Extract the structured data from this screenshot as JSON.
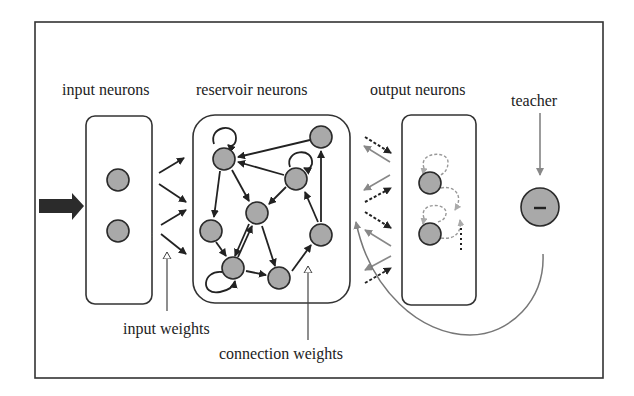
{
  "diagram": {
    "labels": {
      "input_neurons": "input neurons",
      "reservoir_neurons": "reservoir neurons",
      "output_neurons": "output neurons",
      "teacher": "teacher",
      "input_weights": "input weights",
      "connection_weights": "connection weights"
    },
    "teacher_symbol": "–",
    "colors": {
      "frame": "#333333",
      "node_fill": "#a9a9a9",
      "node_stroke": "#2a2a2a",
      "edge": "#222222",
      "feedback_edge": "#888888",
      "dashed_edge": "#999999"
    },
    "groups": [
      {
        "id": "input",
        "label": "input neurons",
        "node_count": 2
      },
      {
        "id": "reservoir",
        "label": "reservoir neurons",
        "node_count": 8
      },
      {
        "id": "output",
        "label": "output neurons",
        "node_count": 2
      },
      {
        "id": "teacher",
        "label": "teacher",
        "node_count": 1
      }
    ],
    "reservoir_nodes": [
      {
        "id": "A",
        "x": 224,
        "y": 159,
        "self_loop": true
      },
      {
        "id": "B",
        "x": 321,
        "y": 137,
        "self_loop": false
      },
      {
        "id": "C",
        "x": 296,
        "y": 179,
        "self_loop": true
      },
      {
        "id": "D",
        "x": 257,
        "y": 213,
        "self_loop": false
      },
      {
        "id": "E",
        "x": 211,
        "y": 231,
        "self_loop": false
      },
      {
        "id": "F",
        "x": 321,
        "y": 235,
        "self_loop": false
      },
      {
        "id": "G",
        "x": 233,
        "y": 268,
        "self_loop": true
      },
      {
        "id": "H",
        "x": 279,
        "y": 278,
        "self_loop": false
      }
    ],
    "reservoir_edges": [
      [
        "B",
        "A"
      ],
      [
        "C",
        "A"
      ],
      [
        "A",
        "E"
      ],
      [
        "A",
        "D"
      ],
      [
        "C",
        "D"
      ],
      [
        "E",
        "G"
      ],
      [
        "D",
        "G"
      ],
      [
        "G",
        "D"
      ],
      [
        "D",
        "H"
      ],
      [
        "G",
        "H"
      ],
      [
        "H",
        "F"
      ],
      [
        "F",
        "C"
      ],
      [
        "F",
        "B"
      ]
    ]
  }
}
